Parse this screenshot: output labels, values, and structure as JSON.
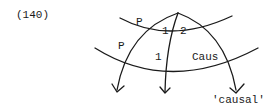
{
  "example_number": "(140)",
  "labels": {
    "p_upper": "P",
    "p_lower": "P",
    "num_1_upper": "1",
    "num_2_upper": "2",
    "num_1_lower": "1",
    "caus": "Caus",
    "causal": "'causal'"
  },
  "colors": {
    "ink": "#1a1a1a",
    "background": "#ffffff"
  }
}
